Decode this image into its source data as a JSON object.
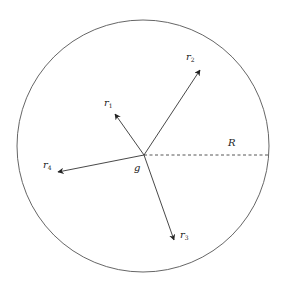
{
  "diagram": {
    "type": "vector-diagram",
    "colors": {
      "stroke": "#333333",
      "circle": "#555555",
      "background": "#ffffff"
    },
    "circle": {
      "cx": 143,
      "cy": 146,
      "r": 126
    },
    "origin": {
      "label": "g",
      "x": 144,
      "y": 155,
      "label_x": 134,
      "label_y": 171
    },
    "radius_line": {
      "label": "R",
      "x1": 144,
      "y1": 155,
      "x2": 269,
      "y2": 155,
      "label_x": 228,
      "label_y": 146,
      "style": "dashed"
    },
    "vectors": [
      {
        "name": "r1",
        "base": "r",
        "sub": "1",
        "x2": 115,
        "y2": 114,
        "label_x": 104,
        "label_y": 106
      },
      {
        "name": "r2",
        "base": "r",
        "sub": "2",
        "x2": 200,
        "y2": 70,
        "label_x": 186,
        "label_y": 60
      },
      {
        "name": "r3",
        "base": "r",
        "sub": "3",
        "x2": 174,
        "y2": 240,
        "label_x": 180,
        "label_y": 238
      },
      {
        "name": "r4",
        "base": "r",
        "sub": "4",
        "x2": 58,
        "y2": 172,
        "label_x": 43,
        "label_y": 168
      }
    ]
  }
}
